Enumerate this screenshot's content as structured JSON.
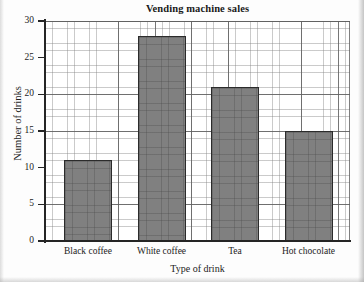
{
  "chart_data": {
    "type": "bar",
    "title": "Vending machine sales",
    "xlabel": "Type of drink",
    "ylabel": "Number of drinks",
    "categories": [
      "Black coffee",
      "White coffee",
      "Tea",
      "Hot chocolate"
    ],
    "values": [
      11,
      28,
      21,
      15
    ],
    "ylim": [
      0,
      30
    ],
    "yticks": [
      0,
      5,
      10,
      15,
      20,
      25,
      30
    ],
    "ytick_labels": [
      "0",
      "5",
      "10",
      "15",
      "20",
      "25",
      "30"
    ],
    "grid": "major-and-minor",
    "legend": "none",
    "bar_fill_color": "#808080",
    "bar_edge_color": "#2b2b2b",
    "axis_color": "#252525",
    "grid_major_color": "#5f5f5f",
    "grid_minor_color": "#828282",
    "background_color": "#ffffff"
  }
}
